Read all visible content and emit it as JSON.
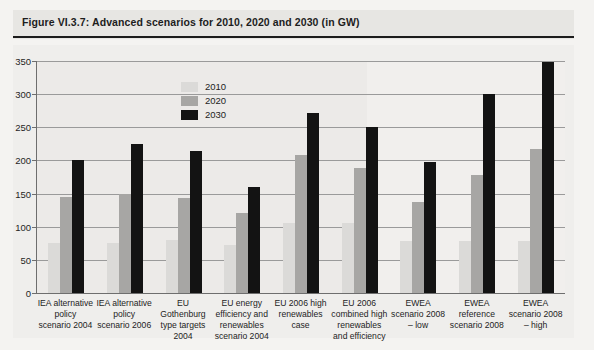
{
  "figure": {
    "title": "Figure VI.3.7: Advanced scenarios for 2010, 2020 and 2030 (in GW)"
  },
  "legend": {
    "position": "inside-top-left",
    "entries": [
      {
        "label": "2010",
        "color": "#dbdad8"
      },
      {
        "label": "2020",
        "color": "#a7a6a4"
      },
      {
        "label": "2030",
        "color": "#131313"
      }
    ]
  },
  "axis": {
    "y_ticks": [
      "0",
      "50",
      "100",
      "150",
      "200",
      "250",
      "300",
      "350"
    ]
  },
  "chart_data": {
    "type": "bar",
    "title": "Figure VI.3.7: Advanced scenarios for 2010, 2020 and 2030 (in GW)",
    "xlabel": "",
    "ylabel": "GW",
    "ylim": [
      0,
      350
    ],
    "ytick_step": 50,
    "grid": true,
    "legend_position": "inside-top-left",
    "categories": [
      "IEA alternative policy scenario 2004",
      "IEA alternative policy scenario 2006",
      "EU Gothenburg type targets 2004",
      "EU energy efficiency and renewables scenario 2004",
      "EU 2006 high renewables case",
      "EU 2006 combined high renewables and efficiency",
      "EWEA scenario 2008 – low",
      "EWEA reference scenario 2008",
      "EWEA scenario 2008 – high"
    ],
    "series": [
      {
        "name": "2010",
        "color": "#dbdad8",
        "values": [
          75,
          75,
          80,
          73,
          105,
          105,
          78,
          78,
          78
        ]
      },
      {
        "name": "2020",
        "color": "#a7a6a4",
        "values": [
          145,
          150,
          143,
          120,
          208,
          188,
          138,
          178,
          217
        ]
      },
      {
        "name": "2030",
        "color": "#131313",
        "values": [
          200,
          225,
          215,
          160,
          272,
          250,
          198,
          300,
          348
        ]
      }
    ]
  }
}
